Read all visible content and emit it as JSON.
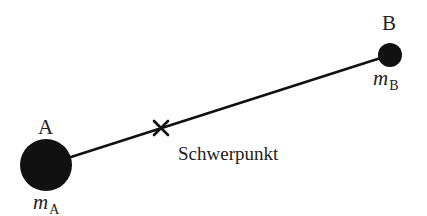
{
  "diagram": {
    "colors": {
      "background": "#ffffff",
      "ink": "#111111",
      "text": "#222222"
    },
    "bodies": [
      {
        "id": "A",
        "label": "A",
        "mass_symbol": "m",
        "mass_subscript": "A",
        "center": [
          46,
          165
        ],
        "radius": 26
      },
      {
        "id": "B",
        "label": "B",
        "mass_symbol": "m",
        "mass_subscript": "B",
        "center": [
          390,
          55
        ],
        "radius": 12
      }
    ],
    "connector": {
      "from": [
        46,
        165
      ],
      "to": [
        390,
        55
      ],
      "stroke_width": 2.6
    },
    "center_of_mass": {
      "marker": "x-mark",
      "position": [
        161,
        128
      ],
      "label": "Schwerpunkt"
    }
  }
}
